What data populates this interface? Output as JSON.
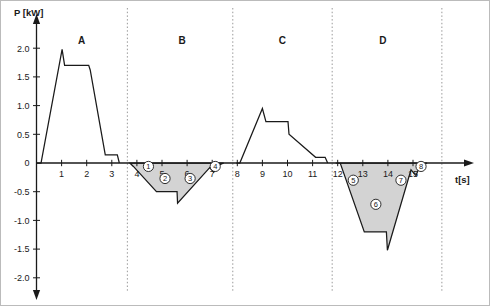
{
  "chart_data": {
    "type": "line",
    "title": "",
    "xlabel": "t[s]",
    "ylabel": "P [kW]",
    "xlim": [
      0,
      16.4
    ],
    "ylim": [
      -2.3,
      2.25
    ],
    "grid": false,
    "legend_position": "none",
    "y_ticks": [
      "2.0",
      "1.5",
      "1.0",
      "0.5",
      "0",
      "-0.5",
      "-1.0",
      "-1.5",
      "-2.0"
    ],
    "y_tick_values": [
      2.0,
      1.5,
      1.0,
      0.5,
      0,
      -0.5,
      -1.0,
      -1.5,
      -2.0
    ],
    "x_ticks": [
      "1",
      "2",
      "3",
      "4",
      "5",
      "6",
      "7",
      "8",
      "9",
      "10",
      "11",
      "12",
      "13",
      "14",
      "15"
    ],
    "x_tick_values": [
      1,
      2,
      3,
      4,
      5,
      6,
      7,
      8,
      9,
      10,
      11,
      12,
      13,
      14,
      15
    ],
    "sections": [
      {
        "label": "A",
        "center_t": 1.8,
        "shaded": false,
        "range": [
          0,
          3.6
        ]
      },
      {
        "label": "B",
        "center_t": 5.8,
        "shaded": true,
        "range": [
          3.6,
          7.8
        ]
      },
      {
        "label": "C",
        "center_t": 9.8,
        "shaded": false,
        "range": [
          7.8,
          11.8
        ]
      },
      {
        "label": "D",
        "center_t": 13.8,
        "shaded": true,
        "range": [
          11.8,
          16.1
        ]
      }
    ],
    "dividers_t": [
      3.62,
      7.82,
      11.78,
      16.15
    ],
    "series": [
      {
        "name": "A",
        "shaded": false,
        "points": [
          [
            0.02,
            0.0
          ],
          [
            0.18,
            0.0
          ],
          [
            1.02,
            1.98
          ],
          [
            1.12,
            1.7
          ],
          [
            2.08,
            1.7
          ],
          [
            2.14,
            1.62
          ],
          [
            2.74,
            0.14
          ],
          [
            3.22,
            0.14
          ],
          [
            3.3,
            0.0
          ]
        ]
      },
      {
        "name": "B",
        "shaded": true,
        "points": [
          [
            3.72,
            0.0
          ],
          [
            3.86,
            -0.06
          ],
          [
            4.78,
            -0.5
          ],
          [
            5.6,
            -0.5
          ],
          [
            5.62,
            -0.7
          ],
          [
            6.9,
            -0.08
          ],
          [
            7.06,
            -0.16
          ],
          [
            7.2,
            -0.05
          ],
          [
            7.46,
            0.0
          ]
        ]
      },
      {
        "name": "C",
        "shaded": false,
        "points": [
          [
            7.96,
            0.0
          ],
          [
            8.1,
            0.0
          ],
          [
            9.0,
            0.95
          ],
          [
            9.14,
            0.72
          ],
          [
            10.02,
            0.72
          ],
          [
            10.06,
            0.5
          ],
          [
            11.12,
            0.1
          ],
          [
            11.5,
            0.1
          ],
          [
            11.6,
            0.0
          ]
        ]
      },
      {
        "name": "D",
        "shaded": true,
        "points": [
          [
            11.92,
            0.0
          ],
          [
            12.1,
            0.0
          ],
          [
            13.06,
            -1.2
          ],
          [
            13.94,
            -1.2
          ],
          [
            13.98,
            -1.52
          ],
          [
            14.92,
            -0.12
          ],
          [
            15.12,
            -0.22
          ],
          [
            15.26,
            -0.06
          ],
          [
            15.56,
            0.0
          ]
        ]
      }
    ],
    "markers": [
      {
        "id": "1",
        "glyph": "1",
        "t": 4.46,
        "p": -0.06
      },
      {
        "id": "2",
        "glyph": "2",
        "t": 5.12,
        "p": -0.27
      },
      {
        "id": "3",
        "glyph": "3",
        "t": 6.12,
        "p": -0.27
      },
      {
        "id": "4",
        "glyph": "4",
        "t": 7.12,
        "p": -0.06
      },
      {
        "id": "5",
        "glyph": "5",
        "t": 12.62,
        "p": -0.3
      },
      {
        "id": "6",
        "glyph": "6",
        "t": 13.52,
        "p": -0.72
      },
      {
        "id": "7",
        "glyph": "7",
        "t": 14.52,
        "p": -0.3
      },
      {
        "id": "8",
        "glyph": "8",
        "t": 15.32,
        "p": -0.06
      }
    ],
    "colors": {
      "line": "#1a1a1a",
      "fill": "#d3d3d3",
      "divider": "#9a9a9a",
      "background": "#ffffff",
      "border": "#bbbbbb"
    }
  }
}
